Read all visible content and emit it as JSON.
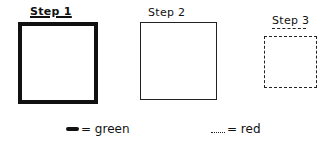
{
  "steps": [
    {
      "label": "Step 1",
      "line_style": "thick-solid",
      "underlined": true
    },
    {
      "label": "Step 2",
      "line_style": "thin-solid"
    },
    {
      "label": "Step 3",
      "line_style": "dashed"
    }
  ],
  "legend": [
    {
      "symbol": "thick-solid-line",
      "text": "= green"
    },
    {
      "symbol": "dashed-line",
      "text": "= red"
    }
  ]
}
